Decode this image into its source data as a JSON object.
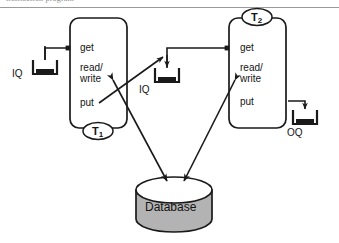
{
  "page": {
    "width": 339,
    "height": 243,
    "background": "#ffffff",
    "cut_header_text": "transaction program"
  },
  "colors": {
    "stroke": "#1a1a1a",
    "text": "#141414",
    "database_fill": "#b3b3b3",
    "database_top_fill": "#ffffff",
    "rule": "#9a9a9a",
    "queue_fill": "#1a1a1a"
  },
  "diagram": {
    "type": "flow-diagram",
    "transactions": [
      {
        "id": "T1",
        "label": "T",
        "subscript": "1",
        "label_position": "bottom",
        "ports": [
          {
            "name": "get",
            "label": "get",
            "direction": "in"
          },
          {
            "name": "read_write",
            "label": "read/\nwrite",
            "line1": "read/",
            "line2": "write",
            "direction": "bidirectional"
          },
          {
            "name": "put",
            "label": "put",
            "direction": "out"
          }
        ]
      },
      {
        "id": "T2",
        "label": "T",
        "subscript": "2",
        "label_position": "top",
        "ports": [
          {
            "name": "get",
            "label": "get",
            "direction": "in"
          },
          {
            "name": "read_write",
            "label": "read/\nwrite",
            "line1": "read/",
            "line2": "write",
            "direction": "bidirectional"
          },
          {
            "name": "put",
            "label": "put",
            "direction": "out"
          }
        ]
      }
    ],
    "queues": [
      {
        "id": "iq-left",
        "label": "IQ",
        "kind": "input-queue",
        "feeds": "T1.get"
      },
      {
        "id": "iq-middle",
        "label": "IQ",
        "kind": "input-queue",
        "feeds": "T2.get",
        "fed_by": "T1.put"
      },
      {
        "id": "oq-right",
        "label": "OQ",
        "kind": "output-queue",
        "fed_by": "T2.put"
      }
    ],
    "store": {
      "id": "database",
      "label": "Database",
      "shape": "cylinder",
      "accessed_by": [
        "T1.read/write",
        "T2.read/write"
      ]
    },
    "edges": [
      {
        "from": "iq-left",
        "to": "T1.get",
        "style": "orthogonal",
        "arrow": "square"
      },
      {
        "from": "T1.put",
        "to": "iq-middle",
        "style": "diagonal",
        "arrow": "open"
      },
      {
        "from": "iq-middle",
        "to": "T2.get",
        "style": "orthogonal",
        "arrow": "square"
      },
      {
        "from": "T2.put",
        "to": "oq-right",
        "style": "orthogonal",
        "arrow": "open"
      },
      {
        "from": "T1.read/write",
        "to": "database",
        "style": "diagonal",
        "arrow": "double"
      },
      {
        "from": "T2.read/write",
        "to": "database",
        "style": "diagonal",
        "arrow": "double"
      }
    ]
  }
}
